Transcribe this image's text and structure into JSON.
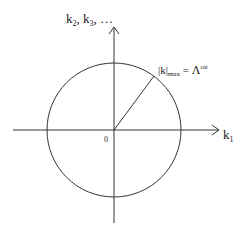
{
  "diagram": {
    "axes": {
      "horizontal": {
        "label_main": "k",
        "label_sub": "1"
      },
      "vertical": {
        "label_parts": [
          {
            "main": "k",
            "sub": "2"
          },
          {
            "main": "k",
            "sub": "3"
          }
        ],
        "label_separator": ", ",
        "label_ellipsis": ", …"
      },
      "origin_label": "0"
    },
    "circle": {
      "center": [
        114,
        130
      ],
      "radius": 67
    },
    "radius_annotation": {
      "lhs_main": "|k|",
      "lhs_sub": "max",
      "equals": " = ",
      "rhs_main": "Λ",
      "rhs_sup": "cut"
    },
    "colors": {
      "stroke": "#333333",
      "text": "#222222",
      "background": "#ffffff"
    }
  }
}
